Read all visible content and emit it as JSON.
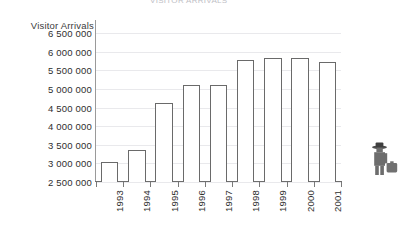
{
  "chart_title": "VISITOR ARRIVALS",
  "axis": {
    "y_title": "Visitor Arrivals",
    "y_ticks": [
      "6 500 000",
      "6 000 000",
      "5 500 000",
      "5 000 000",
      "4 500 000",
      "4 000 000",
      "3 500 000",
      "3 000 000",
      "2 500 000"
    ]
  },
  "icon": {
    "traveler": "traveler-with-suitcase-icon"
  },
  "colors": {
    "bar_fill": "#ffffff",
    "bar_stroke": "#6a6a6a",
    "gridline": "#e9e9ec",
    "axis": "#6e6e6e",
    "text": "#2e2e2e",
    "icon": "#5c5c5c"
  },
  "chart_data": {
    "type": "bar",
    "title": "VISITOR ARRIVALS",
    "xlabel": "",
    "ylabel": "Visitor Arrivals",
    "ylim": [
      2500000,
      6500000
    ],
    "ytick_step": 500000,
    "grid": true,
    "legend": false,
    "categories": [
      "1993",
      "1994",
      "1995",
      "1996",
      "1997",
      "1998",
      "1999",
      "2000",
      "2001"
    ],
    "values": [
      3030000,
      3350000,
      4620000,
      5100000,
      5100000,
      5770000,
      5840000,
      5840000,
      5720000
    ],
    "ytick_labels": [
      "2 500 000",
      "3 000 000",
      "3 500 000",
      "4 000 000",
      "4 500 000",
      "5 000 000",
      "5 500 000",
      "6 000 000",
      "6 500 000"
    ]
  }
}
